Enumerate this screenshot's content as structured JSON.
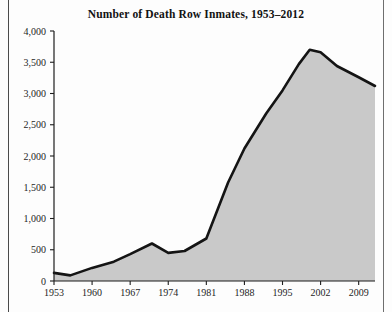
{
  "figure": {
    "title": "Number of Death Row Inmates, 1953–2012",
    "background_color": "#fdfdfd"
  },
  "chart_data": {
    "type": "area",
    "title": "Number of Death Row Inmates, 1953–2012",
    "xlabel": "",
    "ylabel": "",
    "xlim": [
      1953,
      2012
    ],
    "ylim": [
      0,
      4000
    ],
    "grid": false,
    "legend": null,
    "area_fill_color": "#c9c9c9",
    "line_color": "#141414",
    "line_width": 2.6,
    "y_ticks": [
      0,
      500,
      1000,
      1500,
      2000,
      2500,
      3000,
      3500,
      4000
    ],
    "y_tick_labels": [
      "0",
      "500",
      "1,000",
      "1,500",
      "2,000",
      "2,500",
      "3,000",
      "3,500",
      "4,000"
    ],
    "x_ticks": [
      1953,
      1960,
      1967,
      1974,
      1981,
      1988,
      1995,
      2002,
      2009
    ],
    "x_tick_labels": [
      "1953",
      "1960",
      "1967",
      "1974",
      "1981",
      "1988",
      "1995",
      "2002",
      "2009"
    ],
    "x": [
      1953,
      1956,
      1960,
      1964,
      1967,
      1971,
      1974,
      1977,
      1981,
      1985,
      1988,
      1992,
      1995,
      1998,
      2000,
      2002,
      2005,
      2009,
      2012
    ],
    "y": [
      130,
      90,
      210,
      310,
      430,
      600,
      450,
      480,
      680,
      1575,
      2120,
      2680,
      3050,
      3470,
      3700,
      3660,
      3440,
      3260,
      3120
    ],
    "series": [
      {
        "name": "Death row inmates",
        "values": [
          130,
          90,
          210,
          310,
          430,
          600,
          450,
          480,
          680,
          1575,
          2120,
          2680,
          3050,
          3470,
          3700,
          3660,
          3440,
          3260,
          3120
        ]
      }
    ],
    "annotations": []
  },
  "geometry": {
    "plot_left": 54,
    "plot_right": 375,
    "plot_top": 31,
    "plot_bottom": 281,
    "tick_length": 4
  }
}
